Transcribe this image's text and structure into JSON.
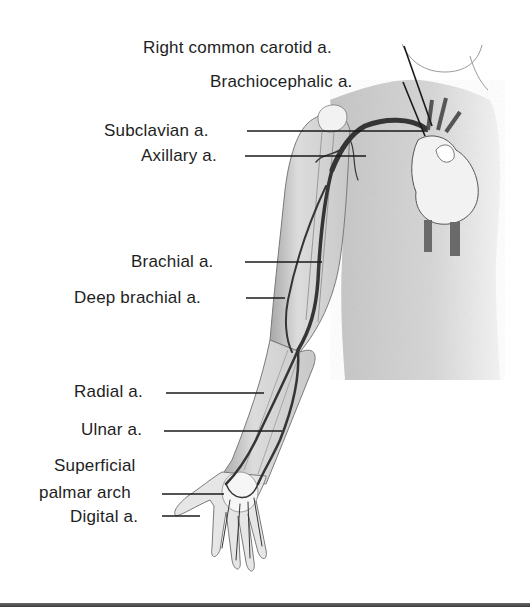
{
  "figure": {
    "labels": [
      {
        "id": "right-common-carotid",
        "text": "Right common carotid a.",
        "x": 143,
        "y": 38,
        "line_from": [
          418,
          50
        ],
        "line_to": [
          430,
          125
        ]
      },
      {
        "id": "brachiocephalic",
        "text": "Brachiocephalic a.",
        "x": 210,
        "y": 73,
        "line_from": [
          403,
          82
        ],
        "line_to": [
          424,
          138
        ]
      },
      {
        "id": "subclavian",
        "text": "Subclavian a.",
        "x": 104,
        "y": 121,
        "line_from": [
          247,
          131
        ],
        "line_to": [
          425,
          131
        ]
      },
      {
        "id": "axillary",
        "text": "Axillary a.",
        "x": 141,
        "y": 146,
        "line_from": [
          245,
          156
        ],
        "line_to": [
          365,
          156
        ]
      },
      {
        "id": "brachial",
        "text": "Brachial a.",
        "x": 131,
        "y": 252,
        "line_from": [
          245,
          262
        ],
        "line_to": [
          322,
          262
        ]
      },
      {
        "id": "deep-brachial",
        "text": "Deep brachial a.",
        "x": 74,
        "y": 288,
        "line_from": [
          246,
          298
        ],
        "line_to": [
          284,
          298
        ]
      },
      {
        "id": "radial",
        "text": "Radial a.",
        "x": 74,
        "y": 382,
        "line_from": [
          166,
          393
        ],
        "line_to": [
          263,
          393
        ]
      },
      {
        "id": "ulnar",
        "text": "Ulnar a.",
        "x": 81,
        "y": 420,
        "line_from": [
          164,
          431
        ],
        "line_to": [
          281,
          431
        ]
      },
      {
        "id": "superficial-palmar-arch-1",
        "text": "Superficial",
        "x": 54,
        "y": 457
      },
      {
        "id": "superficial-palmar-arch-2",
        "text": "palmar arch",
        "x": 39,
        "y": 484,
        "line_from": [
          162,
          494
        ],
        "line_to": [
          222,
          494
        ]
      },
      {
        "id": "digital",
        "text": "Digital a.",
        "x": 70,
        "y": 508,
        "line_from": [
          162,
          516
        ],
        "line_to": [
          200,
          516
        ]
      }
    ]
  },
  "colors": {
    "text": "#1e1e1e",
    "leader_line": "#1a1a1a",
    "skin_shade": "#b8b8b8",
    "artery": "#3c3c3c",
    "background": "#ffffff"
  }
}
